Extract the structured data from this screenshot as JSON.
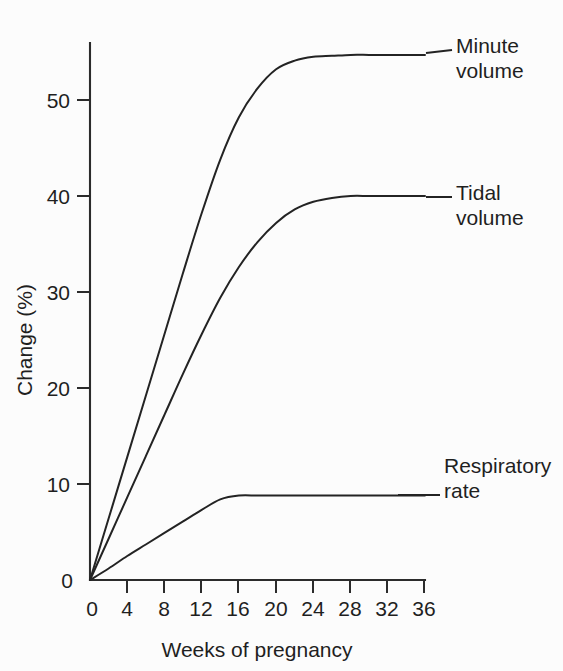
{
  "chart_data": {
    "type": "line",
    "title": "",
    "xlabel": "Weeks of pregnancy",
    "ylabel": "Change (%)",
    "xlim": [
      0,
      36
    ],
    "ylim": [
      0,
      56
    ],
    "grid": false,
    "legend_position": "right-of-curve-ends",
    "xticks": [
      0,
      4,
      8,
      12,
      16,
      20,
      24,
      28,
      32,
      36
    ],
    "xtick_labels": [
      "0",
      "4",
      "8",
      "12",
      "16",
      "20",
      "24",
      "28",
      "32",
      "36"
    ],
    "yticks": [
      0,
      10,
      20,
      30,
      40,
      50
    ],
    "ytick_labels": [
      "0",
      "10",
      "20",
      "30",
      "40",
      "50"
    ],
    "x": [
      0,
      2,
      4,
      6,
      8,
      10,
      12,
      14,
      16,
      18,
      20,
      22,
      24,
      26,
      28,
      30,
      32,
      34,
      36
    ],
    "series": [
      {
        "name": "Minute volume",
        "label_text": "Minute\nvolume",
        "color": "#232323",
        "plateau_value": 54.5,
        "plateau_from_week": 22,
        "values": [
          0,
          6.4,
          12.8,
          19.2,
          25.6,
          32.0,
          38.2,
          43.8,
          48.2,
          51.2,
          53.2,
          54.1,
          54.5,
          54.6,
          54.7,
          54.7,
          54.7,
          54.7,
          54.7
        ]
      },
      {
        "name": "Tidal volume",
        "label_text": "Tidal\nvolume",
        "color": "#232323",
        "plateau_value": 40.0,
        "plateau_from_week": 24,
        "values": [
          0,
          4.3,
          8.6,
          12.9,
          17.2,
          21.5,
          25.6,
          29.4,
          32.6,
          35.2,
          37.2,
          38.6,
          39.4,
          39.8,
          40.0,
          40.0,
          40.0,
          40.0,
          40.0
        ]
      },
      {
        "name": "Respiratory rate",
        "label_text": "Respiratory\nrate",
        "color": "#232323",
        "plateau_value": 8.8,
        "plateau_from_week": 14,
        "values": [
          0,
          1.2,
          2.5,
          3.7,
          4.9,
          6.1,
          7.3,
          8.4,
          8.8,
          8.8,
          8.8,
          8.8,
          8.8,
          8.8,
          8.8,
          8.8,
          8.8,
          8.8,
          8.8
        ]
      }
    ]
  },
  "figure": {
    "background_color": "#fcfcfc",
    "line_color": "#232323",
    "axis_color": "#2b2b2b"
  }
}
